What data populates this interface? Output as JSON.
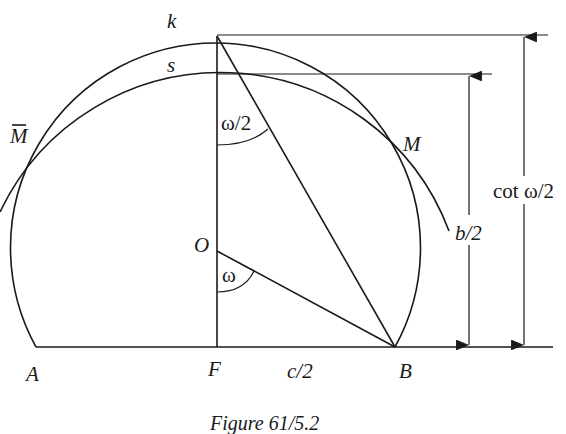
{
  "figure": {
    "caption": "Figure 61/5.2",
    "labels": {
      "k": "k",
      "s": "s",
      "M_bar": "M",
      "M": "M",
      "O": "O",
      "A": "A",
      "F": "F",
      "B": "B",
      "half_c": "c/2",
      "half_b": "b/2",
      "cot": "cot ω/2",
      "omega_half": "ω/2",
      "omega": "ω"
    }
  }
}
